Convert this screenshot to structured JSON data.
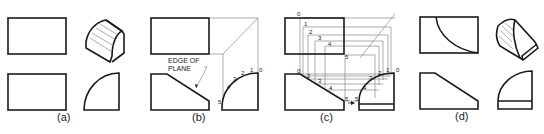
{
  "figure": {
    "panels": [
      {
        "id": "a",
        "label": "(a)"
      },
      {
        "id": "b",
        "label": "(b)",
        "note_line1": "EDGE OF",
        "note_line2": "PLANE",
        "points": [
          "0",
          "1",
          "2",
          "3",
          "4",
          "5"
        ]
      },
      {
        "id": "c",
        "label": "(c)",
        "top_points": [
          "0",
          "1",
          "2",
          "3",
          "4",
          "5"
        ],
        "front_points": [
          "0",
          "1",
          "2",
          "3",
          "4",
          "5"
        ],
        "side_points": [
          "0",
          "1",
          "2",
          "3",
          "4",
          "5"
        ]
      },
      {
        "id": "d",
        "label": "(d)"
      }
    ]
  }
}
